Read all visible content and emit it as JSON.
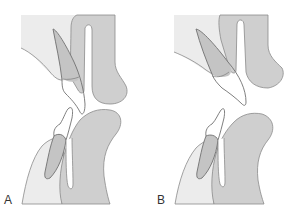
{
  "figure": {
    "panels": [
      {
        "label": "A",
        "description": "Incisor relationship with lips apart"
      },
      {
        "label": "B",
        "description": "Incisor relationship with lips apart, proclined upper incisor"
      }
    ]
  },
  "colors": {
    "soft_tissue_light": "#ececec",
    "lip_gray": "#cfcfcf",
    "tooth_root": "#c4c4c4",
    "outline": "#8a8a8a",
    "tooth_outline": "#707070",
    "label_text": "#333333"
  }
}
